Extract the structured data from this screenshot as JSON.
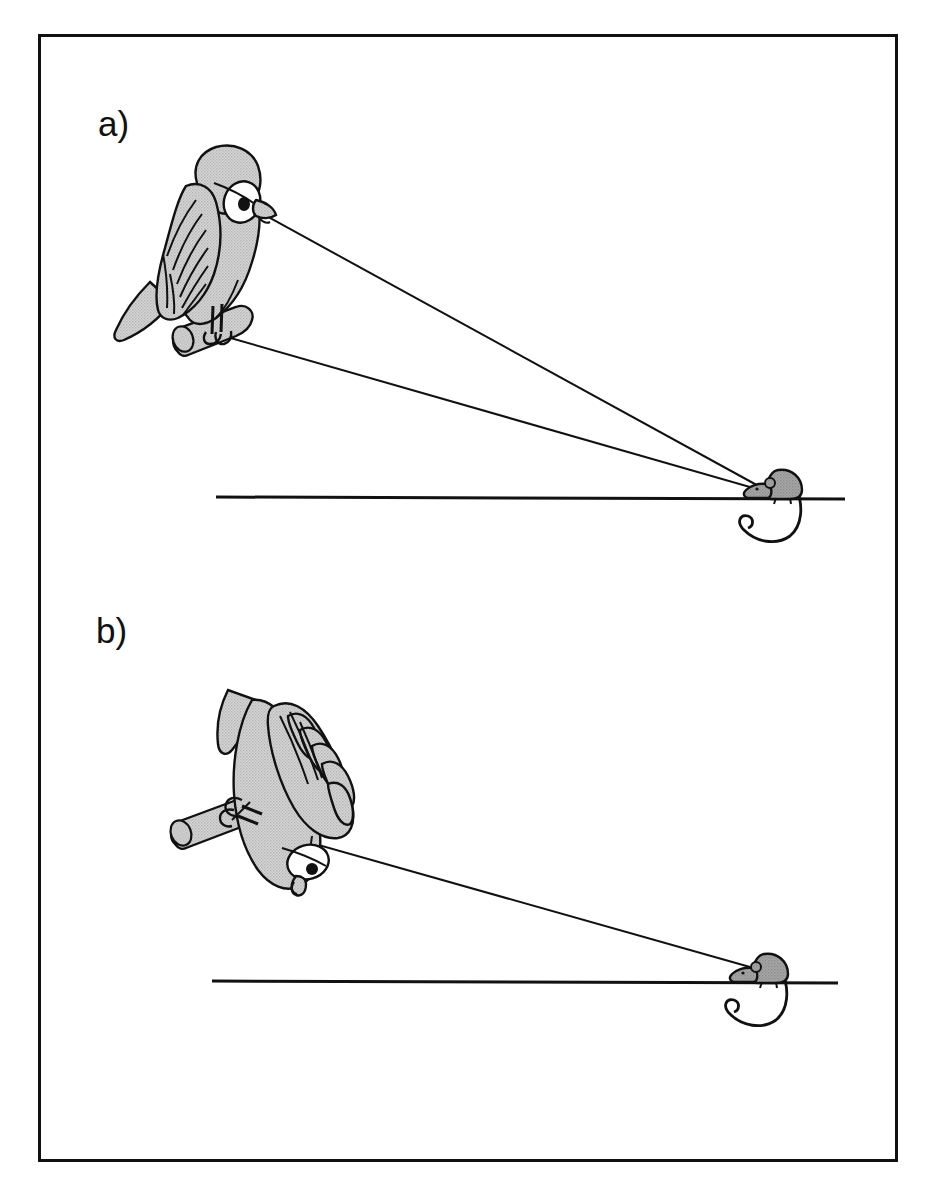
{
  "figure": {
    "type": "diagram",
    "border_color": "#111111",
    "background_color": "#ffffff",
    "fill_gray": "#c8c8c8",
    "outline_color": "#111111",
    "panels": [
      {
        "id": "a",
        "label": "a)",
        "label_position": {
          "x": 98,
          "y": 106
        },
        "description": "Bird perched upright, head held erect, two lines of sight converging on prey",
        "bird": {
          "pose": "upright perched, head turned to viewer right",
          "eye": {
            "x": 243,
            "y": 205,
            "sclera": "white",
            "pupil": "black"
          },
          "beak_tip": {
            "x": 272,
            "y": 215
          },
          "wing": "folded, feather strokes visible",
          "tail": "pointing down-left"
        },
        "perch": {
          "x1": 170,
          "y1": 348,
          "x2": 243,
          "y2": 318,
          "fill": "#c8c8c8"
        },
        "ground_line": {
          "x1": 216,
          "y1": 497,
          "x2": 845,
          "y2": 499
        },
        "sight_lines": [
          {
            "from": "eye",
            "x1": 252,
            "y1": 208,
            "x2": 762,
            "y2": 489
          },
          {
            "from": "feet",
            "x1": 216,
            "y1": 334,
            "x2": 762,
            "y2": 491
          }
        ],
        "prey": {
          "animal": "mouse",
          "facing": "left",
          "x": 762,
          "y": 489,
          "fill": "#8f8f8f",
          "tail": "long, curving below ground line"
        }
      },
      {
        "id": "b",
        "label": "b)",
        "label_position": {
          "x": 96,
          "y": 613
        },
        "description": "Bird hanging head-down with wing spread, single line of sight to prey",
        "bird": {
          "pose": "inverted, head upside-down, wing spread with separated primaries",
          "eye": {
            "x": 311,
            "y": 860,
            "sclera": "white",
            "pupil": "black"
          },
          "beak_tip": {
            "x": 295,
            "y": 884
          },
          "wing": "spread, primary feathers separated",
          "tail": "pointing up-left"
        },
        "perch": {
          "x1": 178,
          "y1": 840,
          "x2": 262,
          "y2": 808,
          "fill": "#c8c8c8"
        },
        "ground_line": {
          "x1": 212,
          "y1": 981,
          "x2": 838,
          "y2": 983
        },
        "sight_lines": [
          {
            "from": "eye",
            "x1": 250,
            "y1": 826,
            "x2": 748,
            "y2": 966
          }
        ],
        "prey": {
          "animal": "mouse",
          "facing": "left",
          "x": 748,
          "y": 966,
          "fill": "#8f8f8f",
          "tail": "long, curving below ground line"
        }
      }
    ]
  }
}
